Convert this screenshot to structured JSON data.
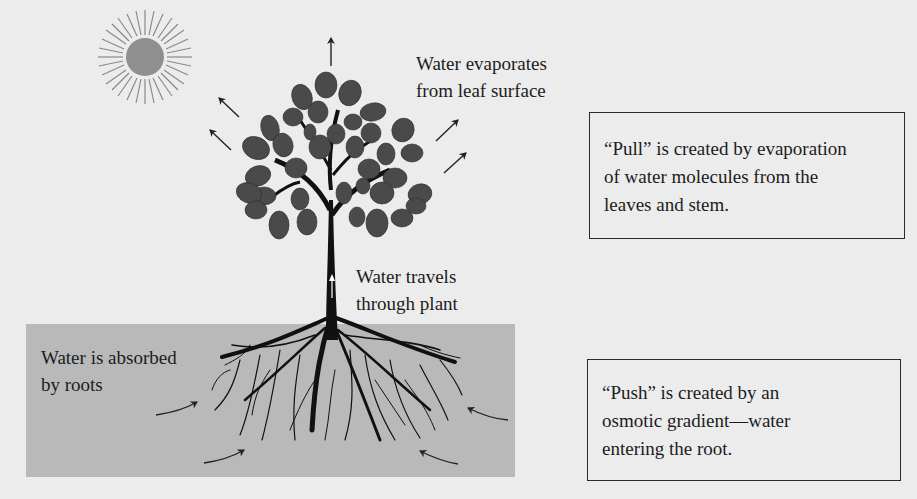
{
  "diagram": {
    "labels": {
      "evaporation": "Water evaporates\nfrom leaf surface",
      "travel": "Water travels\nthrough plant",
      "absorbed": "Water is absorbed\nby roots"
    },
    "callouts": {
      "pull": {
        "lines": [
          "“Pull” is created by evaporation",
          "of water molecules from the",
          "leaves and stem."
        ]
      },
      "push": {
        "lines": [
          "“Push” is created by an",
          "osmotic gradient—water",
          "entering the root."
        ]
      }
    },
    "icons": {
      "sun": "sun-icon",
      "tree": "tree-icon",
      "roots": "roots-icon"
    },
    "colors": {
      "background": "#ececec",
      "soil": "#b9b9b9",
      "sun": "#8f8f8f",
      "leaf": "#4a4a4a",
      "trunk": "#111111"
    }
  }
}
